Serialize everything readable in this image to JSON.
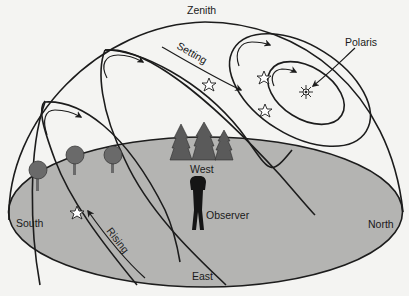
{
  "diagram": {
    "labels": {
      "zenith": "Zenith",
      "setting": "Setting",
      "polaris": "Polaris",
      "west": "West",
      "observer": "Observer",
      "south": "South",
      "north": "North",
      "east": "East",
      "rising": "Rising"
    },
    "colors": {
      "background": "#f4f4f2",
      "ground": "#b4b4b2",
      "lines": "#1c1c1c",
      "trees": "#5e5e5e",
      "observer": "#151515"
    },
    "elements": {
      "dome": "celestial-hemisphere",
      "ground": "horizon-plane",
      "star_paths": [
        "southern-low-path",
        "south-mid-path",
        "zenith-path",
        "circumpolar-outer",
        "circumpolar-inner"
      ],
      "stars": [
        "star-rising",
        "star-setting",
        "star-circumpolar-1",
        "star-circumpolar-2"
      ],
      "pole_star": "polaris",
      "trees": [
        "deciduous-tree-1",
        "deciduous-tree-2",
        "deciduous-tree-3",
        "evergreen-cluster"
      ],
      "observer": "observer-figure"
    }
  }
}
